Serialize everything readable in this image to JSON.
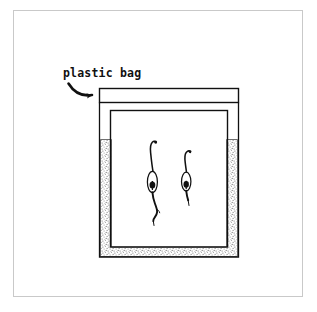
{
  "figure": {
    "annotation": {
      "label": "plastic bag",
      "pointer": "curved-arrow pointing right to the sealed top band of the bag"
    },
    "parts": [
      {
        "name": "bag-seal-band",
        "description": "sealed top strip of the plastic bag"
      },
      {
        "name": "bag-body",
        "description": "transparent plastic bag enclosing the pot"
      },
      {
        "name": "pot",
        "description": "container holding soil, drawn as stippled U-shape"
      },
      {
        "name": "soil",
        "description": "stippled texture lining the pot walls and base"
      },
      {
        "name": "seedling-left",
        "description": "taller sprout with curved shoot and long root"
      },
      {
        "name": "seedling-right",
        "description": "shorter sprout with curved shoot and short root"
      }
    ],
    "colors": {
      "ink": "#111111",
      "page_border": "#c9c9c9",
      "soil_stipple": "#8d8d8d",
      "background": "#ffffff"
    }
  }
}
